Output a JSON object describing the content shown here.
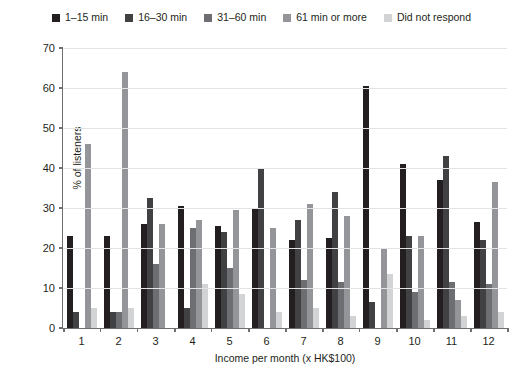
{
  "chart_data": {
    "type": "bar",
    "title": "",
    "xlabel": "Income per month (x HK$100)",
    "ylabel": "% of listeners",
    "categories": [
      "1",
      "2",
      "3",
      "4",
      "5",
      "6",
      "7",
      "8",
      "9",
      "10",
      "11",
      "12"
    ],
    "ylim": [
      0,
      70
    ],
    "yticks": [
      0,
      10,
      20,
      30,
      40,
      50,
      60,
      70
    ],
    "grid": true,
    "legend_position": "top-center",
    "series": [
      {
        "name": "1–15 min",
        "color": "#231f20",
        "values": [
          23,
          23,
          26,
          30.5,
          25.5,
          30,
          22,
          22.5,
          60.5,
          41,
          37,
          26.5
        ]
      },
      {
        "name": "16–30 min",
        "color": "#414042",
        "values": [
          4,
          4,
          32.5,
          5,
          24,
          40,
          27,
          34,
          6.5,
          23,
          43,
          22
        ]
      },
      {
        "name": "31–60 min",
        "color": "#6d6e71",
        "values": [
          0,
          4,
          16,
          25,
          15,
          0,
          12,
          11.5,
          0,
          9,
          11.5,
          11
        ]
      },
      {
        "name": "61 min or more",
        "color": "#939598",
        "values": [
          46,
          64,
          26,
          27,
          29.5,
          25,
          31,
          28,
          20,
          23,
          7,
          36.5
        ]
      },
      {
        "name": "Did not respond",
        "color": "#d1d3d4",
        "values": [
          5,
          5,
          0,
          11,
          8.5,
          4,
          5,
          3,
          13.5,
          2,
          3,
          4
        ]
      }
    ]
  }
}
